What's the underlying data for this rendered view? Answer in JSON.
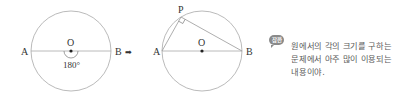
{
  "figure1": {
    "point_a": "A",
    "point_b": "B",
    "center": "O",
    "angle_label": "180°"
  },
  "arrow": "➡",
  "figure2": {
    "point_a": "A",
    "point_b": "B",
    "center": "O",
    "point_p": "P"
  },
  "note": {
    "badge": "잠깐",
    "lines": [
      "원에서의 각의 크기를 구하는",
      "문제에서 아주 많이 이용되는",
      "내용이야."
    ]
  },
  "colors": {
    "line": "#9a9a9a",
    "text": "#333333",
    "note_text": "#5a5a5a",
    "badge_bg": "#8a8a8a"
  }
}
